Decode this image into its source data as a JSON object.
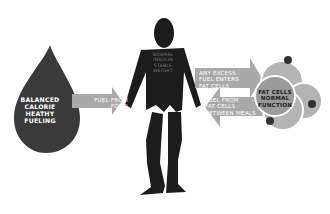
{
  "diagram": {
    "drop": {
      "label_lines": [
        "BALANCED",
        "CALORIE",
        "HEATHY",
        "FUELING"
      ],
      "color": "#3a3a3a"
    },
    "arrow_food": {
      "label_lines": [
        "FUEL FROM",
        "FOOD"
      ],
      "color": "#a9a9a9",
      "direction": "right"
    },
    "figure": {
      "torso_label_lines": [
        "NORMAL",
        "INSULIN",
        "STABLE",
        "WEIGHT"
      ],
      "color": "#1c1c1c"
    },
    "arrow_excess": {
      "label_lines": [
        "ANY EXCESS",
        "FUEL ENTERS",
        "FAT CELLS"
      ],
      "direction": "right",
      "color": "#a9a9a9"
    },
    "arrow_between": {
      "label_lines": [
        "FUEL FROM",
        "FAT CELLS",
        "BETWEEN MEALS"
      ],
      "direction": "left",
      "color": "#a9a9a9"
    },
    "fat_cells": {
      "label_lines": [
        "FAT CELLS",
        "NORMAL",
        "FUNCTION"
      ],
      "cluster_color": "#b4b4b4",
      "center_color": "#9a9a9a",
      "dot_color": "#333333"
    }
  }
}
